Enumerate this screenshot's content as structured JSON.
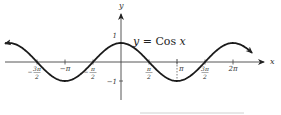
{
  "chart_data": {
    "type": "line",
    "title": "y = Cos x",
    "function": "cos",
    "xlabel": "x",
    "ylabel": "y",
    "x_range_pi": [
      -2.07,
      2.34
    ],
    "ylim": [
      -1,
      1
    ],
    "grid": false,
    "annotations": {
      "dashed_vertical_at_pi": 1
    },
    "x_ticks": [
      {
        "value_pi": -1.5,
        "num": "3π",
        "den": "2",
        "neg": true
      },
      {
        "value_pi": -1.0,
        "label": "−π"
      },
      {
        "value_pi": -0.5,
        "num": "π",
        "den": "2",
        "neg": true
      },
      {
        "value_pi": 0.5,
        "num": "π",
        "den": "2",
        "neg": false
      },
      {
        "value_pi": 1.0,
        "label": "π"
      },
      {
        "value_pi": 1.5,
        "num": "3π",
        "den": "2",
        "neg": false
      },
      {
        "value_pi": 2.0,
        "label": "2π"
      }
    ],
    "y_ticks": [
      {
        "value": 1,
        "label": "1"
      },
      {
        "value": -1,
        "label": "−1"
      }
    ]
  }
}
